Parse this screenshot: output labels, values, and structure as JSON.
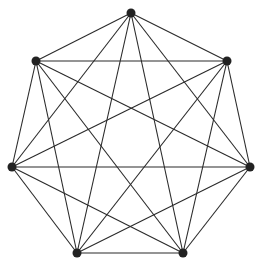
{
  "diagram": {
    "type": "complete-graph",
    "name": "K7",
    "node_color": "#222222",
    "edge_color": "#2a2a2a",
    "node_radius": 4.5,
    "nodes": [
      {
        "id": "v0",
        "x": 131,
        "y": 13
      },
      {
        "id": "v1",
        "x": 227,
        "y": 61
      },
      {
        "id": "v2",
        "x": 250,
        "y": 167
      },
      {
        "id": "v3",
        "x": 183,
        "y": 253
      },
      {
        "id": "v4",
        "x": 77,
        "y": 253
      },
      {
        "id": "v5",
        "x": 12,
        "y": 167
      },
      {
        "id": "v6",
        "x": 36,
        "y": 61
      }
    ]
  }
}
